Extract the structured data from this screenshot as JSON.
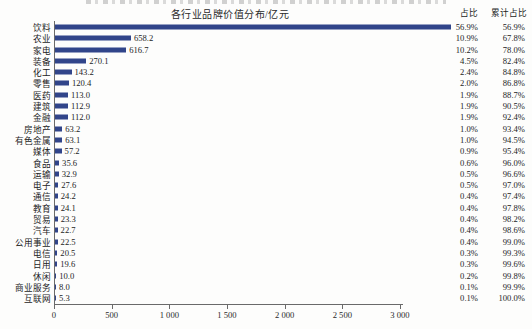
{
  "page": {
    "title": "各行业品牌价值分布/亿元",
    "col_header_pct": "占比",
    "col_header_cum": "累计占比"
  },
  "chart_data": {
    "type": "bar",
    "orientation": "horizontal",
    "title": "各行业品牌价值分布/亿元",
    "xlabel": "",
    "ylabel": "",
    "xlim": [
      0,
      3000
    ],
    "x_tick_labels": [
      "0",
      "500",
      "1 000",
      "1 500",
      "2 000",
      "2 500",
      "3 000"
    ],
    "x_tick_values": [
      0,
      500,
      1000,
      1500,
      2000,
      2500,
      3000
    ],
    "bar_color": "#31458A",
    "grid": false,
    "categories": [
      "饮料",
      "农业",
      "家电",
      "装备",
      "化工",
      "零售",
      "医药",
      "建筑",
      "金融",
      "房地产",
      "有色金属",
      "媒体",
      "食品",
      "运输",
      "电子",
      "通信",
      "教育",
      "贸易",
      "汽车",
      "公用事业",
      "电信",
      "日用",
      "休闲",
      "商业服务",
      "互联网"
    ],
    "values": [
      3435.9,
      658.2,
      616.7,
      270.1,
      143.2,
      120.4,
      113.0,
      112.9,
      112.0,
      63.2,
      63.1,
      57.2,
      35.6,
      32.9,
      27.6,
      24.2,
      24.1,
      23.3,
      22.7,
      22.5,
      20.5,
      19.6,
      10.0,
      8.0,
      5.3
    ],
    "bar_value_labels": [
      "",
      "658.2",
      "616.7",
      "270.1",
      "143.2",
      "120.4",
      "113.0",
      "112.9",
      "112.0",
      "63.2",
      "63.1",
      "57.2",
      "35.6",
      "32.9",
      "27.6",
      "24.2",
      "24.1",
      "23.3",
      "22.7",
      "22.5",
      "20.5",
      "19.6",
      "10.0",
      "8.0",
      "5.3"
    ],
    "pct": [
      "56.9%",
      "10.9%",
      "10.2%",
      "4.5%",
      "2.4%",
      "2.0%",
      "1.9%",
      "1.9%",
      "1.9%",
      "1.0%",
      "1.0%",
      "0.9%",
      "0.6%",
      "0.5%",
      "0.5%",
      "0.4%",
      "0.4%",
      "0.4%",
      "0.4%",
      "0.4%",
      "0.3%",
      "0.3%",
      "0.2%",
      "0.1%",
      "0.1%"
    ],
    "cum_pct": [
      "56.9%",
      "67.8%",
      "78.0%",
      "82.4%",
      "84.8%",
      "86.8%",
      "88.7%",
      "90.5%",
      "92.4%",
      "93.4%",
      "94.5%",
      "95.4%",
      "96.0%",
      "96.6%",
      "97.0%",
      "97.4%",
      "97.8%",
      "98.2%",
      "98.6%",
      "99.0%",
      "99.3%",
      "99.6%",
      "99.8%",
      "99.9%",
      "100.0%"
    ],
    "note": "饮料 bar value not labeled on chart; 3435.9 estimated from 56.9% share"
  }
}
